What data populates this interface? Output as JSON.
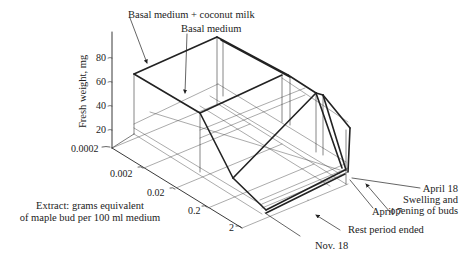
{
  "diagram": {
    "type": "3d-surface-plot",
    "y_axis": {
      "label": "Fresh weight, mg",
      "ticks": [
        "80",
        "60",
        "40",
        "20"
      ]
    },
    "depth_axis": {
      "label_line1": "Extract: grams equivalent",
      "label_line2": "of maple bud per 100 ml medium",
      "ticks": [
        "0.0002",
        "0.002",
        "0.02",
        "0.2",
        "2"
      ]
    },
    "annotations": {
      "basal_coconut": "Basal medium + coconut milk",
      "basal": "Basal medium",
      "april18": "April 18",
      "swelling_line1": "Swelling and",
      "swelling_line2": "opening of buds",
      "april7": "April 7",
      "rest_period": "Rest period ended",
      "nov18": "Nov. 18"
    }
  }
}
